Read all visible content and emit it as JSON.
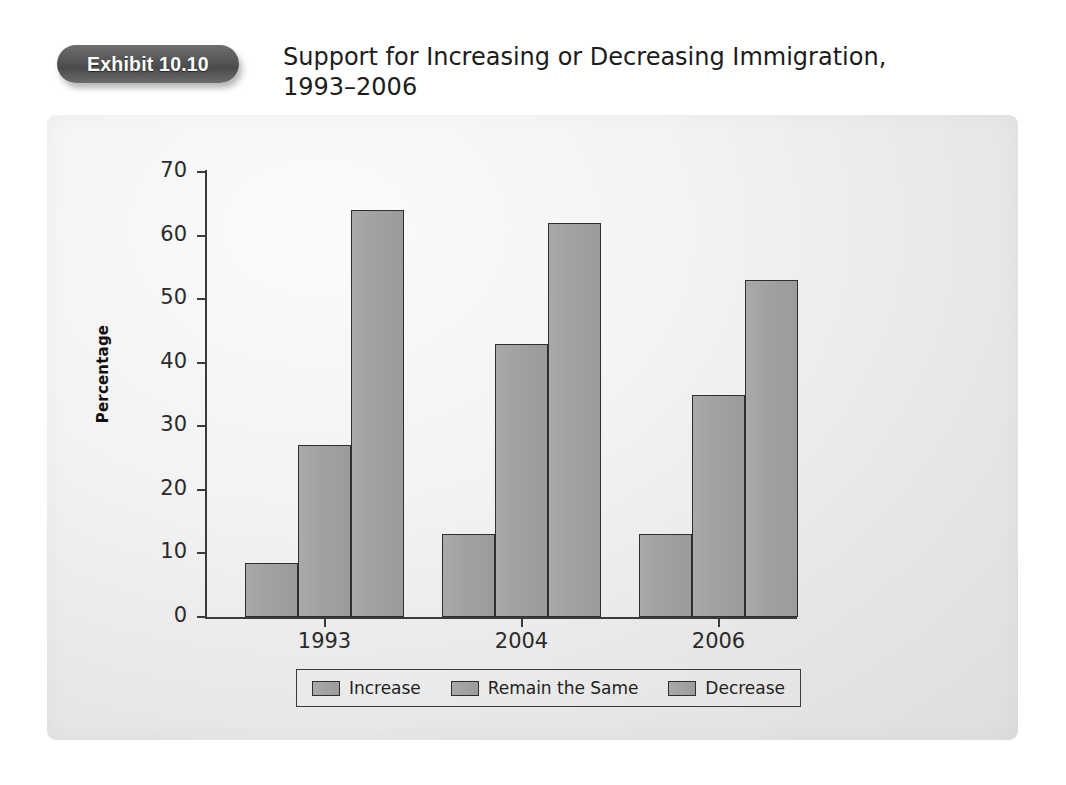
{
  "header": {
    "badge_label": "Exhibit 10.10",
    "title_line1": "Support for Increasing or Decreasing Immigration,",
    "title_line2": "1993–2006"
  },
  "chart_data": {
    "type": "bar",
    "title": "Support for Increasing or Decreasing Immigration, 1993–2006",
    "xlabel": "",
    "ylabel": "Percentage",
    "ylim": [
      0,
      70
    ],
    "yticks": [
      0,
      10,
      20,
      30,
      40,
      50,
      60,
      70
    ],
    "grid": false,
    "legend_position": "bottom",
    "categories": [
      "1993",
      "2004",
      "2006"
    ],
    "series": [
      {
        "name": "Increase",
        "values": [
          8.5,
          13,
          13
        ]
      },
      {
        "name": "Remain the Same",
        "values": [
          27,
          43,
          35
        ]
      },
      {
        "name": "Decrease",
        "values": [
          64,
          62,
          53
        ]
      }
    ],
    "bar_color": "#a2a2a2",
    "bar_outline": "#2f2f2f",
    "panel_color": "#eeeeee"
  },
  "legend": {
    "items": [
      {
        "label": "Increase"
      },
      {
        "label": "Remain the Same"
      },
      {
        "label": "Decrease"
      }
    ]
  },
  "colors": {
    "badge": "#5a5a5a",
    "axis": "#3a3a3a",
    "text": "#1c1c1c"
  }
}
